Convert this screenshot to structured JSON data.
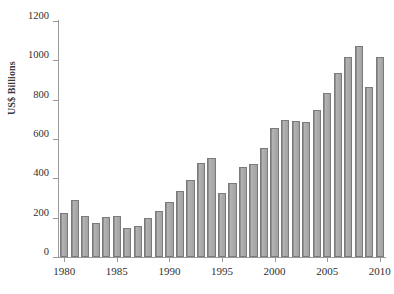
{
  "chart_data": {
    "type": "bar",
    "title": "",
    "subtitle": "",
    "xlabel": "",
    "ylabel": "US$ Billions",
    "categories": [
      "1980",
      "1981",
      "1982",
      "1983",
      "1984",
      "1985",
      "1986",
      "1987",
      "1988",
      "1989",
      "1990",
      "1991",
      "1992",
      "1993",
      "1994",
      "1995",
      "1996",
      "1997",
      "1998",
      "1999",
      "2000",
      "2001",
      "2002",
      "2003",
      "2004",
      "2005",
      "2006",
      "2007",
      "2008",
      "2009",
      "2010"
    ],
    "values": [
      225,
      288,
      211,
      171,
      201,
      211,
      147,
      160,
      196,
      236,
      280,
      337,
      392,
      480,
      502,
      326,
      378,
      457,
      474,
      554,
      658,
      697,
      693,
      687,
      745,
      833,
      935,
      1016,
      1075,
      862,
      1019
    ],
    "ylim": [
      0,
      1200
    ],
    "yticks": [
      0,
      200,
      400,
      600,
      800,
      1000,
      1200
    ],
    "ytick_labels": [
      "0",
      "200",
      "400",
      "600",
      "800",
      "1000",
      "1200"
    ],
    "xtick_labels": [
      "1980",
      "1985",
      "1990",
      "1995",
      "2000",
      "2005",
      "2010"
    ],
    "xticks": [
      1980,
      1985,
      1990,
      1995,
      2000,
      2005,
      2010
    ],
    "grid": false,
    "legend": null,
    "bar_color": "#a6a6a6",
    "bar_edge_color": "#7b7b7b",
    "axis_color": "#9a9a9a",
    "background_color": "#ffffff"
  }
}
